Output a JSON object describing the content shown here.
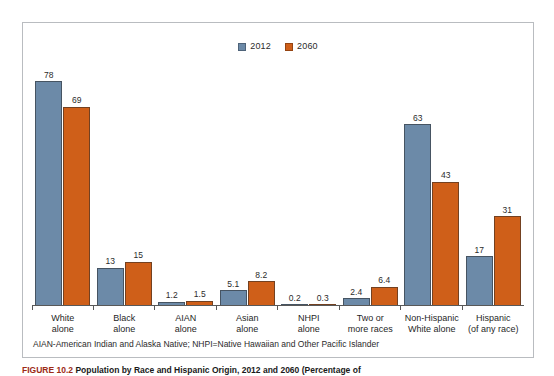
{
  "chart_data": {
    "type": "bar",
    "title": "",
    "xlabel": "",
    "ylabel": "",
    "ylim": [
      0,
      85
    ],
    "grid": false,
    "legend_position": "top-center",
    "categories": [
      "White alone",
      "Black alone",
      "AIAN alone",
      "Asian alone",
      "NHPI alone",
      "Two or more races",
      "Non-Hispanic White alone",
      "Hispanic (of any race)"
    ],
    "category_lines": [
      [
        "White",
        "alone"
      ],
      [
        "Black",
        "alone"
      ],
      [
        "AIAN",
        "alone"
      ],
      [
        "Asian",
        "alone"
      ],
      [
        "NHPI",
        "alone"
      ],
      [
        "Two or",
        "more races"
      ],
      [
        "Non-Hispanic",
        "White alone"
      ],
      [
        "Hispanic",
        "(of any race)"
      ]
    ],
    "series": [
      {
        "name": "2012",
        "color": "#6c8aa8",
        "values": [
          78,
          13,
          1.2,
          5.1,
          0.2,
          2.4,
          63,
          17
        ],
        "labels": [
          "78",
          "13",
          "1.2",
          "5.1",
          "0.2",
          "2.4",
          "63",
          "17"
        ]
      },
      {
        "name": "2060",
        "color": "#cf5f19",
        "values": [
          69,
          15,
          1.5,
          8.2,
          0.3,
          6.4,
          43,
          31
        ],
        "labels": [
          "69",
          "15",
          "1.5",
          "8.2",
          "0.3",
          "6.4",
          "43",
          "31"
        ]
      }
    ]
  },
  "legend": {
    "entries": [
      {
        "label": "2012",
        "color": "#6c8aa8"
      },
      {
        "label": "2060",
        "color": "#cf5f19"
      }
    ]
  },
  "footnote": "AIAN-American Indian and Alaska Native; NHPI=Native Hawaiian and Other Pacific Islander",
  "caption": {
    "number": "FIGURE 10.2",
    "text": "Population by Race and Hispanic Origin, 2012 and 2060 (Percentage of"
  }
}
